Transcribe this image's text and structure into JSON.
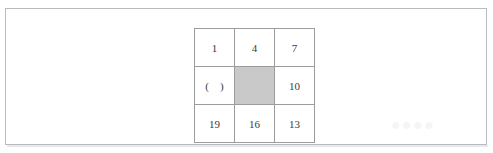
{
  "page": {
    "background_color": "#ffffff",
    "border_color": "#b9bcbe",
    "watermark_text": "••••"
  },
  "grid": {
    "rows": 3,
    "columns": 3,
    "line_color": "#9a9c9e",
    "shaded_cell_color": "#c9c9c9",
    "text_color": "#3a3a3a",
    "cells": [
      [
        {
          "value": "1",
          "kind": "number"
        },
        {
          "value": "4",
          "kind": "number"
        },
        {
          "value": "7",
          "kind": "number"
        }
      ],
      [
        {
          "value": "(    )",
          "kind": "blank"
        },
        {
          "value": "",
          "kind": "shaded"
        },
        {
          "value": "10",
          "kind": "number"
        }
      ],
      [
        {
          "value": "19",
          "kind": "number"
        },
        {
          "value": "16",
          "kind": "number"
        },
        {
          "value": "13",
          "kind": "number"
        }
      ]
    ]
  },
  "chart_data": {
    "type": "table",
    "title": "",
    "columns": [
      "col1",
      "col2",
      "col3"
    ],
    "rows": [
      [
        "1",
        "4",
        "7"
      ],
      [
        "(    )",
        "",
        "10"
      ],
      [
        "19",
        "16",
        "13"
      ]
    ]
  }
}
